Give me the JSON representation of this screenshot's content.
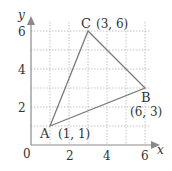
{
  "figure": {
    "axes": {
      "x_label": "x",
      "y_label": "y",
      "origin_label": "0",
      "x_ticks": [
        "2",
        "4",
        "6"
      ],
      "y_ticks": [
        "2",
        "4",
        "6"
      ]
    },
    "points": [
      {
        "name": "A",
        "coords": "(1, 1)"
      },
      {
        "name": "B",
        "coords": "(6, 3)"
      },
      {
        "name": "C",
        "coords": "(3, 6)"
      }
    ],
    "colors": {
      "grid": "#aaaaaa",
      "triangle": "#777777",
      "axis": "#888888"
    }
  }
}
